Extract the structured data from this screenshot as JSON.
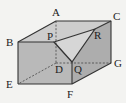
{
  "diagram": {
    "type": "cuboid with corner cut off by plane PQR",
    "labels": {
      "A": "A",
      "B": "B",
      "C": "C",
      "D": "D",
      "E": "E",
      "F": "F",
      "G": "G",
      "P": "P",
      "Q": "Q",
      "R": "R"
    },
    "colors": {
      "background": "#f3f3f1",
      "front_face": "#b9b9b9",
      "top_face": "#cdcdcd",
      "right_face": "#adadad",
      "cut_face": "#d6d6d6",
      "edge": "#333333"
    }
  }
}
